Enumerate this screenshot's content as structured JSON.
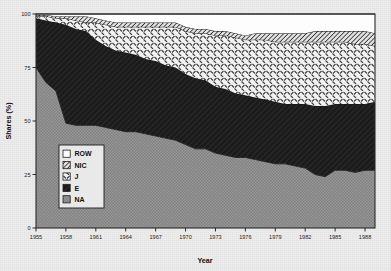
{
  "figure": {
    "background_color": "#ededed",
    "plot_background": "#ffffff",
    "frame_color": "#2b2b2b"
  },
  "axes": {
    "x_title": "Year",
    "y_title": "Shares (%)",
    "x_ticks": [
      "1955",
      "1958",
      "1961",
      "1964",
      "1967",
      "1970",
      "1973",
      "1976",
      "1979",
      "1982",
      "1985",
      "1988"
    ],
    "y_ticks": [
      "0",
      "25",
      "50",
      "75",
      "100"
    ],
    "x_min": 1955,
    "x_max": 1989,
    "y_min": 0,
    "y_max": 100
  },
  "legend": {
    "position": "inside-left",
    "items": [
      {
        "label": "ROW",
        "pattern": "solid-white",
        "color": "#ffffff"
      },
      {
        "label": "NIC",
        "pattern": "diagonal-hatch",
        "color": "#d9d9d9"
      },
      {
        "label": "J",
        "pattern": "cross-hatch-light",
        "color": "#f0f0f0"
      },
      {
        "label": "E",
        "pattern": "dense-diagonal-dark",
        "color": "#1e1e1e"
      },
      {
        "label": "NA",
        "pattern": "gray-stipple",
        "color": "#8f8f8f"
      }
    ]
  },
  "chart_data": {
    "type": "area",
    "stacked": true,
    "title": "",
    "xlabel": "Year",
    "ylabel": "Shares (%)",
    "xlim": [
      1955,
      1989
    ],
    "ylim": [
      0,
      100
    ],
    "grid": false,
    "legend_position": "inside-left",
    "x": [
      1955,
      1956,
      1957,
      1958,
      1959,
      1960,
      1961,
      1962,
      1963,
      1964,
      1965,
      1966,
      1967,
      1968,
      1969,
      1970,
      1971,
      1972,
      1973,
      1974,
      1975,
      1976,
      1977,
      1978,
      1979,
      1980,
      1981,
      1982,
      1983,
      1984,
      1985,
      1986,
      1987,
      1988,
      1989
    ],
    "series": [
      {
        "name": "NA",
        "label": "NA",
        "order": 1,
        "values": [
          75,
          68,
          64,
          49,
          48,
          48,
          48,
          47,
          46,
          45,
          45,
          44,
          43,
          42,
          41,
          39,
          37,
          37,
          35,
          34,
          33,
          33,
          32,
          31,
          30,
          30,
          29,
          28,
          25,
          24,
          27,
          27,
          26,
          27,
          27
        ]
      },
      {
        "name": "E",
        "label": "E",
        "order": 2,
        "values": [
          23,
          29,
          32,
          46,
          45,
          44,
          40,
          38,
          37,
          37,
          36,
          35,
          35,
          34,
          34,
          33,
          33,
          32,
          31,
          31,
          30,
          29,
          29,
          29,
          29,
          28,
          29,
          30,
          32,
          33,
          31,
          31,
          32,
          31,
          32
        ]
      },
      {
        "name": "J",
        "label": "J",
        "order": 3,
        "values": [
          1,
          2,
          2,
          3,
          4,
          4,
          8,
          10,
          11,
          12,
          13,
          15,
          16,
          18,
          19,
          20,
          21,
          22,
          24,
          25,
          26,
          26,
          27,
          28,
          28,
          29,
          29,
          29,
          30,
          30,
          29,
          29,
          28,
          28,
          26
        ]
      },
      {
        "name": "NIC",
        "label": "NIC",
        "order": 4,
        "values": [
          0.5,
          0.5,
          1,
          1,
          2,
          3,
          2,
          2,
          2,
          2,
          2,
          2,
          2,
          2,
          2,
          2,
          2,
          2,
          2,
          2,
          2,
          2,
          3,
          3,
          4,
          4,
          4,
          4,
          5,
          5,
          5,
          5,
          6,
          6,
          6
        ]
      },
      {
        "name": "ROW",
        "label": "ROW",
        "order": 5,
        "values": [
          0.5,
          0.5,
          1,
          1,
          1,
          1,
          2,
          3,
          4,
          4,
          4,
          4,
          4,
          4,
          4,
          6,
          7,
          7,
          8,
          8,
          9,
          10,
          9,
          9,
          9,
          9,
          9,
          9,
          8,
          8,
          8,
          8,
          8,
          8,
          9
        ]
      }
    ]
  }
}
